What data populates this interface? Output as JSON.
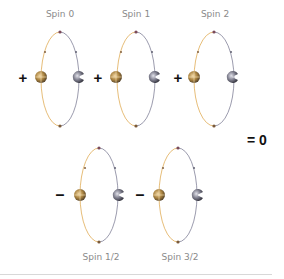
{
  "diagram": {
    "title": "",
    "colors": {
      "orange_path": "#e3b56a",
      "gray_path": "#8a8aa0",
      "orange_sphere": "#b08a4a",
      "gray_sphere": "#6e6e7a",
      "vertex": "#7a4a4a",
      "sign": "#111111",
      "label": "#8a8a8a"
    },
    "top_row": [
      {
        "label": "Spin 0",
        "sign": "+"
      },
      {
        "label": "Spin 1",
        "sign": "+"
      },
      {
        "label": "Spin 2",
        "sign": "+"
      }
    ],
    "bottom_row": [
      {
        "label": "Spin 1/2",
        "sign": "–"
      },
      {
        "label": "Spin 3/2",
        "sign": "–"
      }
    ],
    "result": "= 0"
  }
}
